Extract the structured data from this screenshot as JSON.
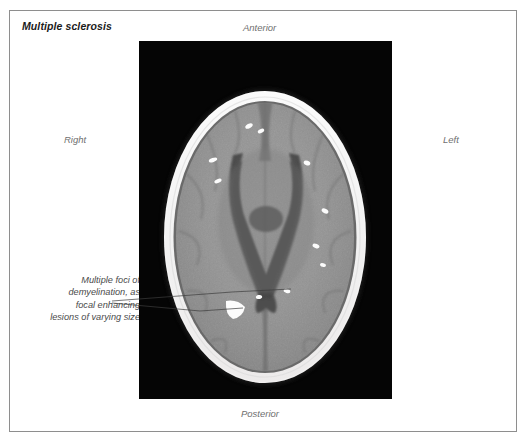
{
  "figure": {
    "title": "Multiple sclerosis",
    "modality": "axial contrast-enhanced CT brain",
    "frame_color": "#8e8e8e",
    "background_color": "#ffffff"
  },
  "orientation_labels": {
    "anterior": "Anterior",
    "posterior": "Posterior",
    "right": "Right",
    "left": "Left",
    "color": "#6f6f6f"
  },
  "annotation": {
    "lines": [
      "Multiple foci of",
      "demyelination, as",
      "focal enhancing",
      "lesions of varying size"
    ],
    "color": "#4a4a4a",
    "leader_line_color": "#3c3c3c"
  },
  "scan": {
    "panel_background": "#050505",
    "skull_color": "#f2f2f2",
    "brain_color": "#8f8f8f",
    "ventricle_color": "#4b4b4b",
    "lesion_color": "#fdfdfd",
    "lesion_count": 11,
    "lesions": [
      {
        "cx": 110,
        "cy": 85,
        "rx": 4.0,
        "ry": 2.2,
        "rot": -28
      },
      {
        "cx": 122,
        "cy": 90,
        "rx": 3.4,
        "ry": 1.9,
        "rot": -25
      },
      {
        "cx": 74,
        "cy": 119,
        "rx": 4.4,
        "ry": 2.0,
        "rot": -20
      },
      {
        "cx": 79,
        "cy": 140,
        "rx": 3.8,
        "ry": 1.9,
        "rot": -22
      },
      {
        "cx": 168,
        "cy": 122,
        "rx": 3.4,
        "ry": 2.3,
        "rot": 20
      },
      {
        "cx": 186,
        "cy": 170,
        "rx": 3.6,
        "ry": 2.2,
        "rot": 28
      },
      {
        "cx": 177,
        "cy": 205,
        "rx": 3.6,
        "ry": 2.1,
        "rot": 22
      },
      {
        "cx": 184,
        "cy": 224,
        "rx": 3.0,
        "ry": 1.9,
        "rot": 15
      },
      {
        "cx": 148,
        "cy": 250,
        "rx": 3.4,
        "ry": 2.0,
        "rot": 18
      },
      {
        "cx": 120,
        "cy": 256,
        "rx": 3.2,
        "ry": 2.0,
        "rot": -10
      },
      {
        "cx": 96,
        "cy": 268,
        "rx": 8.5,
        "ry": 6.0,
        "rot": 12
      }
    ]
  }
}
